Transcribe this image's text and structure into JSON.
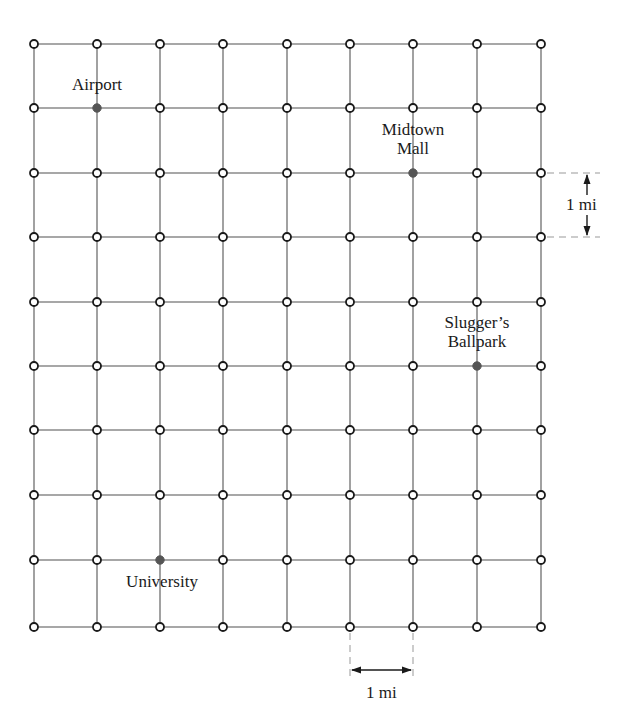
{
  "diagram": {
    "type": "city street grid map",
    "grid": {
      "columns": 9,
      "rows": 10,
      "x_positions": [
        34,
        97,
        160,
        223,
        287,
        350,
        413,
        477,
        541
      ],
      "y_positions": [
        44,
        108,
        173,
        237,
        302,
        366,
        430,
        495,
        560,
        627
      ],
      "line_color": "#8a8a8a",
      "node_fill": "#ffffff",
      "node_stroke": "#1a1a1a",
      "node_radius": 4
    },
    "locations": [
      {
        "name": "Airport",
        "label_lines": [
          "Airport"
        ],
        "col": 1,
        "row": 1,
        "color": "#555555"
      },
      {
        "name": "Midtown Mall",
        "label_lines": [
          "Midtown",
          "Mall"
        ],
        "col": 6,
        "row": 2,
        "color": "#555555"
      },
      {
        "name": "Slugger's Ballpark",
        "label_lines": [
          "Slugger’s",
          "Ballpark"
        ],
        "col": 7,
        "row": 5,
        "color": "#555555"
      },
      {
        "name": "University",
        "label_lines": [
          "University"
        ],
        "col": 2,
        "row": 8,
        "color": "#555555"
      }
    ],
    "scale": {
      "vertical": {
        "label": "1 mi",
        "between_rows": [
          2,
          3
        ]
      },
      "horizontal": {
        "label": "1 mi",
        "between_cols": [
          5,
          6
        ]
      }
    }
  }
}
